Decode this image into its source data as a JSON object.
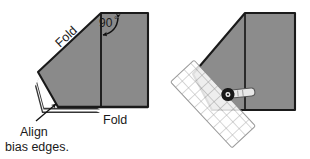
{
  "figure": {
    "type": "instructional-diagram",
    "background_color": "#ffffff",
    "fabric_color": "#8a8a8a",
    "fabric_color_right": "#8c8c8c",
    "outline_color": "#1a1a1a",
    "text_color": "#1a1a1a"
  },
  "left_panel": {
    "name": "folded-fabric-with-labels",
    "labels": {
      "fold_diagonal": "Fold",
      "fold_bottom": "Fold",
      "angle": "90",
      "angle_degree_symbol": "°",
      "align_line1": "Align",
      "align_line2": "bias edges."
    }
  },
  "right_panel": {
    "name": "fabric-with-ruler-and-rotary-cutter",
    "tools": {
      "ruler": "gridded-quilting-ruler",
      "cutter": "rotary-cutter"
    },
    "ruler": {
      "grid_columns": 5,
      "grid_rows": 22,
      "rotation_deg": 47,
      "fill": "#ffffff",
      "grid_line_color": "#9a9a9a",
      "opacity": 0.82
    },
    "cutter": {
      "blade_color": "#1a1a1a",
      "handle_color": "#e3e3e3",
      "handle_outline": "#4a4a4a"
    }
  }
}
